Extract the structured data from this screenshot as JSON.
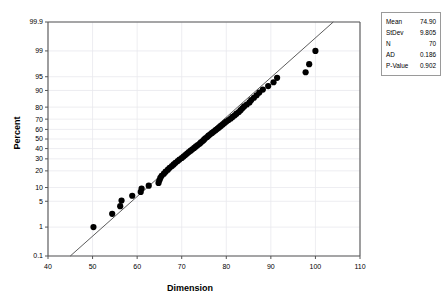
{
  "chart_data": {
    "type": "scatter",
    "title": "",
    "subtitle": "",
    "xlabel": "Dimension",
    "ylabel": "Percent",
    "plot_kind": "normal-probability-plot",
    "xlim": [
      40,
      110
    ],
    "ylim_percent": [
      0.1,
      99.9
    ],
    "grid": true,
    "legend": "none",
    "xticks": [
      40,
      50,
      60,
      70,
      80,
      90,
      100,
      110
    ],
    "yticks": [
      0.1,
      1,
      5,
      10,
      20,
      30,
      40,
      50,
      60,
      70,
      80,
      90,
      95,
      99,
      99.9
    ],
    "fit_line": {
      "label": "normal-distribution-fit-line",
      "x_start": 45.0,
      "y_start_percent": 0.1,
      "x_end": 104.0,
      "y_end_percent": 99.9
    },
    "points": [
      {
        "x": 50.2,
        "p": 1.0
      },
      {
        "x": 54.4,
        "p": 2.4
      },
      {
        "x": 56.2,
        "p": 3.8
      },
      {
        "x": 56.5,
        "p": 5.2
      },
      {
        "x": 58.9,
        "p": 6.7
      },
      {
        "x": 60.8,
        "p": 8.1
      },
      {
        "x": 61.0,
        "p": 9.5
      },
      {
        "x": 62.6,
        "p": 10.9
      },
      {
        "x": 64.8,
        "p": 12.3
      },
      {
        "x": 65.0,
        "p": 13.8
      },
      {
        "x": 65.2,
        "p": 15.2
      },
      {
        "x": 65.5,
        "p": 16.6
      },
      {
        "x": 66.0,
        "p": 18.0
      },
      {
        "x": 66.4,
        "p": 19.4
      },
      {
        "x": 66.9,
        "p": 20.9
      },
      {
        "x": 67.3,
        "p": 22.3
      },
      {
        "x": 67.8,
        "p": 23.7
      },
      {
        "x": 68.2,
        "p": 25.1
      },
      {
        "x": 68.6,
        "p": 26.5
      },
      {
        "x": 69.1,
        "p": 28.0
      },
      {
        "x": 69.5,
        "p": 29.4
      },
      {
        "x": 70.0,
        "p": 30.8
      },
      {
        "x": 70.4,
        "p": 32.2
      },
      {
        "x": 70.8,
        "p": 33.6
      },
      {
        "x": 71.2,
        "p": 35.1
      },
      {
        "x": 71.6,
        "p": 36.5
      },
      {
        "x": 72.0,
        "p": 37.9
      },
      {
        "x": 72.4,
        "p": 39.3
      },
      {
        "x": 72.8,
        "p": 40.7
      },
      {
        "x": 73.2,
        "p": 42.2
      },
      {
        "x": 73.6,
        "p": 43.6
      },
      {
        "x": 74.0,
        "p": 45.0
      },
      {
        "x": 74.3,
        "p": 46.4
      },
      {
        "x": 74.7,
        "p": 47.8
      },
      {
        "x": 75.0,
        "p": 49.3
      },
      {
        "x": 75.3,
        "p": 50.7
      },
      {
        "x": 75.7,
        "p": 52.1
      },
      {
        "x": 76.0,
        "p": 53.5
      },
      {
        "x": 76.4,
        "p": 54.9
      },
      {
        "x": 76.8,
        "p": 56.4
      },
      {
        "x": 77.2,
        "p": 57.8
      },
      {
        "x": 77.6,
        "p": 59.2
      },
      {
        "x": 78.0,
        "p": 60.6
      },
      {
        "x": 78.4,
        "p": 62.0
      },
      {
        "x": 78.8,
        "p": 63.5
      },
      {
        "x": 79.2,
        "p": 64.9
      },
      {
        "x": 79.6,
        "p": 66.3
      },
      {
        "x": 80.0,
        "p": 67.7
      },
      {
        "x": 80.5,
        "p": 69.1
      },
      {
        "x": 81.0,
        "p": 70.6
      },
      {
        "x": 81.4,
        "p": 72.0
      },
      {
        "x": 81.9,
        "p": 73.4
      },
      {
        "x": 82.3,
        "p": 74.8
      },
      {
        "x": 82.8,
        "p": 76.2
      },
      {
        "x": 83.2,
        "p": 77.7
      },
      {
        "x": 83.6,
        "p": 79.1
      },
      {
        "x": 84.0,
        "p": 80.5
      },
      {
        "x": 84.6,
        "p": 81.9
      },
      {
        "x": 85.2,
        "p": 83.3
      },
      {
        "x": 85.6,
        "p": 84.8
      },
      {
        "x": 86.2,
        "p": 86.2
      },
      {
        "x": 86.8,
        "p": 87.6
      },
      {
        "x": 87.4,
        "p": 89.0
      },
      {
        "x": 88.2,
        "p": 90.4
      },
      {
        "x": 89.4,
        "p": 91.9
      },
      {
        "x": 90.6,
        "p": 93.3
      },
      {
        "x": 91.4,
        "p": 94.7
      },
      {
        "x": 97.8,
        "p": 96.1
      },
      {
        "x": 98.6,
        "p": 97.6
      },
      {
        "x": 100.0,
        "p": 99.0
      }
    ]
  },
  "stats_box": {
    "name": "descriptive-statistics-box",
    "rows": [
      {
        "label": "Mean",
        "value": "74.90"
      },
      {
        "label": "StDev",
        "value": "9.805"
      },
      {
        "label": "N",
        "value": "70"
      },
      {
        "label": "AD",
        "value": "0.186"
      },
      {
        "label": "P-Value",
        "value": "0.902"
      }
    ]
  },
  "colors": {
    "marker": "#000000",
    "fit_line": "#4a4a4a",
    "grid": "#e9e9ee",
    "frame": "#555555",
    "text": "#000000",
    "box_border": "#9a9a9a",
    "background": "#ffffff"
  }
}
